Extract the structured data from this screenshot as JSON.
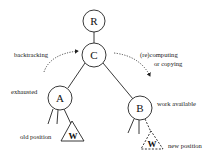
{
  "diagram": {
    "nodes": {
      "root": {
        "label": "R"
      },
      "current": {
        "label": "C"
      },
      "left": {
        "label": "A",
        "annotation": "exhausted"
      },
      "right": {
        "label": "B",
        "annotation": "work available"
      }
    },
    "subtrees": {
      "old": {
        "label": "W",
        "annotation": "old position",
        "style": "solid"
      },
      "new": {
        "label": "W",
        "annotation": "new position",
        "style": "dashed"
      }
    },
    "arrows": {
      "backtracking": {
        "label": "backtracking",
        "style": "dotted"
      },
      "recompute": {
        "label_line1": "(re)computing",
        "label_line2": "or copying",
        "style": "dotted"
      }
    },
    "colors": {
      "stroke": "#222222",
      "text": "#111111",
      "background": "#ffffff"
    }
  }
}
